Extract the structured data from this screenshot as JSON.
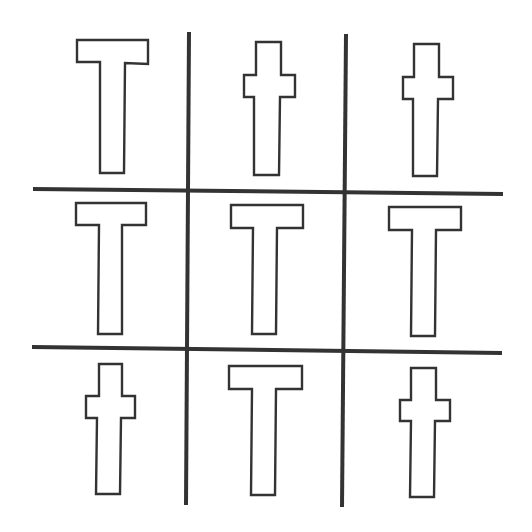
{
  "diagram": {
    "colors": {
      "background": "#ffffff",
      "stroke": "#333333",
      "fill": "#ffffff"
    },
    "grid": {
      "vertical_lines": [
        {
          "x1": 189,
          "y1": 32,
          "x2": 186,
          "y2": 505
        },
        {
          "x1": 346,
          "y1": 34,
          "x2": 342,
          "y2": 507
        }
      ],
      "horizontal_lines": [
        {
          "x1": 33,
          "y1": 189,
          "x2": 503,
          "y2": 194
        },
        {
          "x1": 32,
          "y1": 347,
          "x2": 502,
          "y2": 353
        }
      ]
    },
    "cells": [
      {
        "row": 0,
        "col": 0,
        "shape": "T",
        "points": "77,40 148,40 148,64 125,63 124,173 100,173 100,62 77,62"
      },
      {
        "row": 0,
        "col": 1,
        "shape": "cross",
        "points": "256,42 281,42 281,75 295,75 295,97 280,97 279,175 254,175 254,97 244,97 244,75 256,75"
      },
      {
        "row": 0,
        "col": 2,
        "shape": "cross",
        "points": "414,44 439,44 439,77 453,77 453,99 438,99 437,176 413,176 413,99 403,99 403,77 414,77"
      },
      {
        "row": 1,
        "col": 0,
        "shape": "T",
        "points": "76,203 146,203 146,225 122,225 122,334 98,334 99,225 76,225"
      },
      {
        "row": 1,
        "col": 1,
        "shape": "T",
        "points": "231,205 303,205 303,228 277,228 276,334 252,334 253,228 231,228"
      },
      {
        "row": 1,
        "col": 2,
        "shape": "T",
        "points": "389,207 461,207 461,230 436,230 435,336 411,336 412,230 389,230"
      },
      {
        "row": 2,
        "col": 0,
        "shape": "cross",
        "points": "99,364 122,364 122,396 135,396 135,418 121,418 120,494 96,494 97,418 86,418 86,396 99,396"
      },
      {
        "row": 2,
        "col": 1,
        "shape": "T",
        "points": "229,366 302,366 302,389 276,389 275,495 251,495 252,389 229,389"
      },
      {
        "row": 2,
        "col": 2,
        "shape": "cross",
        "points": "411,368 436,368 436,400 450,400 450,421 435,421 434,497 410,497 411,421 400,421 400,400 411,400"
      }
    ],
    "shape_counts": {
      "T": 5,
      "cross": 4
    }
  }
}
